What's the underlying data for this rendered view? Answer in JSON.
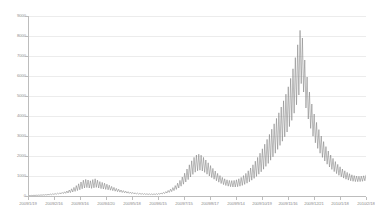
{
  "chart_data": {
    "type": "line",
    "title": "",
    "subtitle": "",
    "xlabel": "",
    "ylabel": "",
    "ylim": [
      0,
      9000
    ],
    "grid": true,
    "legend": false,
    "legend_position": "none",
    "line_color": "#808080",
    "gridline_color": "#ececec",
    "axis_color": "#bdbdbd",
    "y_ticks": [
      0,
      1000,
      2000,
      3000,
      4000,
      5000,
      6000,
      7000,
      8000,
      9000
    ],
    "y_tick_labels": [
      "0",
      "1000",
      "2000",
      "3000",
      "4000",
      "5000",
      "6000",
      "7000",
      "8000",
      "9000"
    ],
    "x_tick_labels": [
      "2009/1/19",
      "2009/2/16",
      "2009/3/16",
      "2009/4/20",
      "2009/5/18",
      "2009/6/15",
      "2009/7/15",
      "2009/8/17",
      "2009/9/14",
      "2009/10/19",
      "2009/11/16",
      "2009/12/21",
      "2010/1/18",
      "2010/2/18"
    ],
    "x_tick_positions": [
      0.0,
      0.0769,
      0.1538,
      0.2308,
      0.3077,
      0.3846,
      0.4615,
      0.5385,
      0.6154,
      0.6923,
      0.7692,
      0.8462,
      0.9231,
      1.0
    ],
    "series": [
      {
        "name": "cases",
        "values": [
          20,
          24,
          18,
          30,
          22,
          35,
          26,
          40,
          30,
          48,
          34,
          55,
          40,
          62,
          45,
          70,
          52,
          80,
          58,
          95,
          66,
          110,
          75,
          125,
          85,
          140,
          95,
          160,
          105,
          180,
          120,
          210,
          135,
          250,
          150,
          300,
          170,
          360,
          200,
          430,
          230,
          520,
          270,
          610,
          310,
          700,
          360,
          790,
          400,
          830,
          420,
          800,
          400,
          760,
          380,
          820,
          410,
          860,
          430,
          790,
          400,
          720,
          370,
          680,
          350,
          640,
          330,
          590,
          310,
          540,
          290,
          480,
          265,
          430,
          240,
          380,
          215,
          340,
          195,
          300,
          175,
          270,
          160,
          240,
          145,
          215,
          130,
          195,
          118,
          175,
          108,
          160,
          98,
          145,
          90,
          135,
          84,
          125,
          80,
          118,
          76,
          112,
          73,
          108,
          70,
          105,
          70,
          108,
          72,
          115,
          78,
          128,
          88,
          150,
          102,
          180,
          122,
          220,
          148,
          275,
          180,
          340,
          220,
          420,
          270,
          520,
          330,
          640,
          400,
          780,
          490,
          950,
          590,
          1140,
          700,
          1350,
          820,
          1560,
          950,
          1760,
          1080,
          1930,
          1190,
          2050,
          1260,
          2090,
          1290,
          2040,
          1250,
          1930,
          1180,
          1800,
          1090,
          1660,
          1000,
          1520,
          920,
          1380,
          840,
          1250,
          760,
          1130,
          690,
          1020,
          625,
          930,
          570,
          860,
          525,
          810,
          490,
          780,
          465,
          770,
          450,
          780,
          450,
          810,
          465,
          860,
          490,
          930,
          530,
          1020,
          580,
          1130,
          640,
          1260,
          710,
          1400,
          790,
          1560,
          880,
          1740,
          980,
          1930,
          1090,
          2140,
          1210,
          2360,
          1340,
          2590,
          1480,
          2830,
          1630,
          3080,
          1790,
          3340,
          1960,
          3610,
          2140,
          3880,
          2330,
          4160,
          2530,
          4450,
          2740,
          4760,
          2960,
          5090,
          3200,
          5460,
          3470,
          5880,
          3780,
          6360,
          4140,
          6920,
          4560,
          7560,
          5050,
          8280,
          5620,
          7900,
          5200,
          6800,
          4400,
          5950,
          3850,
          5200,
          3380,
          4600,
          2990,
          4100,
          2660,
          3680,
          2380,
          3320,
          2140,
          3000,
          1930,
          2720,
          1750,
          2470,
          1590,
          2250,
          1450,
          2050,
          1330,
          1880,
          1220,
          1720,
          1120,
          1580,
          1035,
          1460,
          960,
          1350,
          895,
          1260,
          840,
          1180,
          795,
          1115,
          760,
          1060,
          735,
          1020,
          720,
          995,
          715,
          985,
          720,
          990,
          735,
          1010,
          760,
          1040
        ]
      }
    ]
  }
}
